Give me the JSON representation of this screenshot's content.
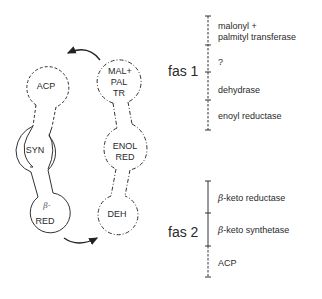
{
  "diagram": {
    "left_chain": {
      "nodes": [
        {
          "id": "acp",
          "label": "ACP",
          "line": "dashed"
        },
        {
          "id": "syn",
          "label": "SYN",
          "line": "solid"
        },
        {
          "id": "beta_red",
          "label_prefix": "β-",
          "label": "RED",
          "line": "solid"
        }
      ]
    },
    "right_chain": {
      "nodes": [
        {
          "id": "mal_pal_tr",
          "label_lines": [
            "MAL+",
            "PAL",
            "TR"
          ],
          "line": "dash-dot"
        },
        {
          "id": "enol_red",
          "label_lines": [
            "ENOL",
            "RED"
          ],
          "line": "dash-dot"
        },
        {
          "id": "deh",
          "label": "DEH",
          "line": "dash-dot"
        }
      ]
    },
    "arrows": [
      {
        "from": "mal_pal_tr",
        "to": "acp",
        "position": "top"
      },
      {
        "from": "beta_red",
        "to": "deh",
        "position": "bottom"
      }
    ],
    "genes": [
      {
        "label": "fas 1",
        "domains": [
          {
            "label_lines": [
              "malonyl +",
              "palmityl  transferase"
            ]
          },
          {
            "label": "?"
          },
          {
            "label": "dehydrase"
          },
          {
            "label": "enoyl  reductase"
          }
        ]
      },
      {
        "label": "fas 2",
        "domains": [
          {
            "prefix": "β",
            "label": "-keto  reductase"
          },
          {
            "prefix": "β",
            "label": "-keto  synthetase"
          },
          {
            "label": "ACP"
          }
        ]
      }
    ]
  }
}
